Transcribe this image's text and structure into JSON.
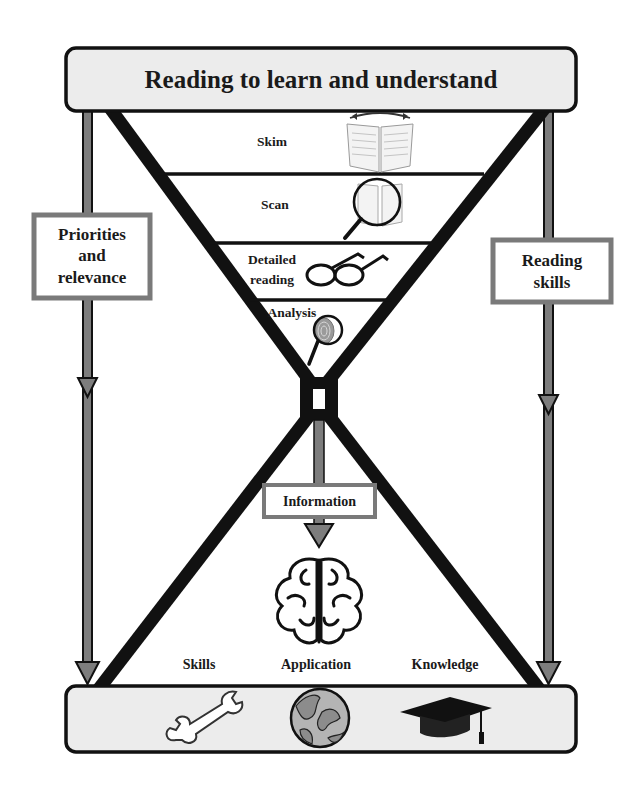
{
  "title": "Reading to learn and understand",
  "funnel_levels": [
    {
      "label": "Skim",
      "icon": "open-book-icon"
    },
    {
      "label": "Scan",
      "icon": "magnifier-book-icon"
    },
    {
      "label_line1": "Detailed",
      "label_line2": "reading",
      "icon": "glasses-icon"
    },
    {
      "label": "Analysis",
      "icon": "fingerprint-magnifier-icon"
    }
  ],
  "left_box": {
    "line1": "Priorities",
    "line2": "and",
    "line3": "relevance"
  },
  "right_box": {
    "line1": "Reading",
    "line2": "skills"
  },
  "center_box": {
    "label": "Information"
  },
  "center_icon": "brain-icon",
  "outcomes": [
    {
      "label": "Skills",
      "icon": "wrench-icon"
    },
    {
      "label": "Application",
      "icon": "globe-icon"
    },
    {
      "label": "Knowledge",
      "icon": "graduation-cap-icon"
    }
  ],
  "colors": {
    "banner_fill": "#ececec",
    "stroke": "#111111",
    "box_border": "#7a7a7a",
    "arrow_fill": "#7d7d7d"
  }
}
